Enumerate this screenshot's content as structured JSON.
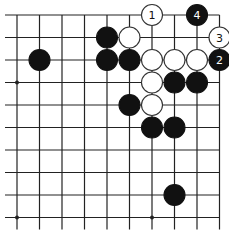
{
  "diagram": {
    "type": "go-board-fragment",
    "columns": 10,
    "rows": 10,
    "edges": {
      "top": true,
      "right": true,
      "left": false,
      "bottom": false
    },
    "origin": {
      "x": 17,
      "y": 15
    },
    "spacing": 22.5,
    "stone_radius": 10.5,
    "colors": {
      "line": "#222222",
      "black": "#111111",
      "white": "#ffffff",
      "background": "#ffffff"
    },
    "star_points": [
      {
        "col": 0,
        "row": 3
      },
      {
        "col": 0,
        "row": 9
      },
      {
        "col": 6,
        "row": 9
      }
    ],
    "stones": [
      {
        "col": 6,
        "row": 0,
        "color": "white",
        "label": "1"
      },
      {
        "col": 8,
        "row": 0,
        "color": "black",
        "label": "4"
      },
      {
        "col": 9,
        "row": 1,
        "color": "white",
        "label": "3"
      },
      {
        "col": 9,
        "row": 2,
        "color": "black",
        "label": "2"
      },
      {
        "col": 4,
        "row": 1,
        "color": "black",
        "label": ""
      },
      {
        "col": 5,
        "row": 1,
        "color": "white",
        "label": ""
      },
      {
        "col": 1,
        "row": 2,
        "color": "black",
        "label": ""
      },
      {
        "col": 4,
        "row": 2,
        "color": "black",
        "label": ""
      },
      {
        "col": 5,
        "row": 2,
        "color": "black",
        "label": ""
      },
      {
        "col": 6,
        "row": 2,
        "color": "white",
        "label": ""
      },
      {
        "col": 7,
        "row": 2,
        "color": "white",
        "label": ""
      },
      {
        "col": 8,
        "row": 2,
        "color": "white",
        "label": ""
      },
      {
        "col": 6,
        "row": 3,
        "color": "white",
        "label": ""
      },
      {
        "col": 7,
        "row": 3,
        "color": "black",
        "label": ""
      },
      {
        "col": 8,
        "row": 3,
        "color": "black",
        "label": ""
      },
      {
        "col": 5,
        "row": 4,
        "color": "black",
        "label": ""
      },
      {
        "col": 6,
        "row": 4,
        "color": "white",
        "label": ""
      },
      {
        "col": 6,
        "row": 5,
        "color": "black",
        "label": ""
      },
      {
        "col": 7,
        "row": 5,
        "color": "black",
        "label": ""
      },
      {
        "col": 7,
        "row": 8,
        "color": "black",
        "label": ""
      }
    ]
  }
}
